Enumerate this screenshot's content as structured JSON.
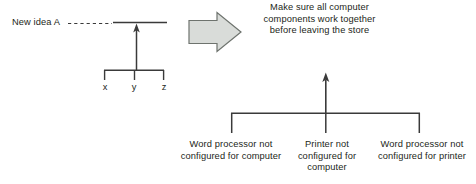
{
  "diagram": {
    "left": {
      "annotation": "New idea A",
      "connector": "dashed-line",
      "spine_arrow": "up-arrow",
      "branch_labels": [
        "x",
        "y",
        "z"
      ]
    },
    "transition": {
      "icon": "right-block-arrow",
      "fill": "#d9dcd9",
      "stroke": "#6e736e"
    },
    "right": {
      "effect": "Make sure all\ncomputer\ncomponents work\ntogether before\nleaving the store",
      "spine_arrow": "up-arrow",
      "causes": [
        "Word processor\nnot configured for\ncomputer",
        "Printer not\nconfigured for\ncomputer",
        "Word processor\nnot configured for\nprinter"
      ]
    }
  },
  "colors": {
    "background": "#ffffff",
    "ink": "#231f20",
    "line": "#3a3a3a",
    "arrow_fill": "#d9dcd9",
    "arrow_stroke": "#6e736e"
  }
}
